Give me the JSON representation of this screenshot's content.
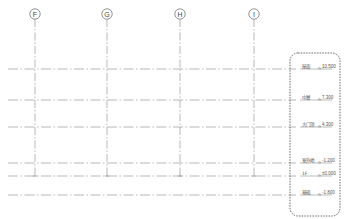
{
  "drawing": {
    "type": "elevation-levels-and-grids",
    "colors": {
      "line": "#9a9a9a",
      "text": "#555555",
      "highlight_box": "#555555",
      "background": "#ffffff"
    },
    "grids": [
      {
        "label": "F",
        "x": 35
      },
      {
        "label": "G",
        "x": 107
      },
      {
        "label": "H",
        "x": 180
      },
      {
        "label": "I",
        "x": 254
      }
    ],
    "levels": [
      {
        "name": "屋面",
        "elevation": "10.500",
        "y": 69,
        "sign": "",
        "grid_cut": false
      },
      {
        "name": "中層",
        "elevation": "7.300",
        "y": 100,
        "sign": "",
        "grid_cut": false
      },
      {
        "name": "大门顶",
        "elevation": "4.300",
        "y": 127,
        "sign": "",
        "grid_cut": false
      },
      {
        "name": "室外地",
        "elevation": "-1.200",
        "y": 163,
        "sign": "",
        "grid_cut": false
      },
      {
        "name": "1F",
        "elevation": "0.000",
        "y": 176,
        "sign": "±",
        "grid_cut": true
      },
      {
        "name": "基础",
        "elevation": "-1.800",
        "y": 195,
        "sign": "",
        "grid_cut": false
      }
    ],
    "highlight_box": {
      "x": 290,
      "y": 53,
      "width": 50,
      "height": 163,
      "label": "level-tags-selection"
    }
  }
}
